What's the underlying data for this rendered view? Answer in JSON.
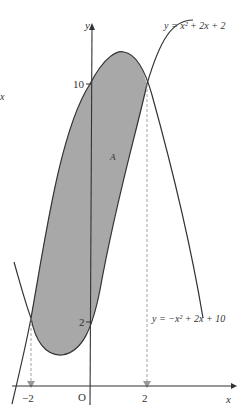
{
  "diagram": {
    "curves": [
      {
        "name": "upward-parabola",
        "equation": "y = x² + 2x + 2"
      },
      {
        "name": "downward-parabola",
        "equation": "y = −x² + 2x + 10"
      }
    ],
    "region_label": "A",
    "axes": {
      "x_label": "x",
      "y_label": "y",
      "origin_label": "O"
    },
    "ticks": {
      "x": [
        "−2",
        "2"
      ],
      "y": [
        "10",
        "2"
      ]
    },
    "side_label": "x",
    "colors": {
      "fill": "#a8a8a8",
      "stroke": "#333333",
      "dashed": "#999999",
      "background": "#ffffff"
    }
  }
}
